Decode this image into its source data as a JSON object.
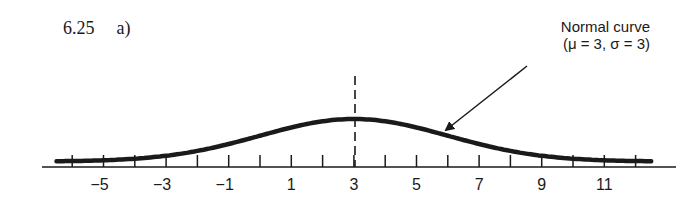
{
  "problem": {
    "number": "6.25",
    "part": "a)"
  },
  "annotation": {
    "line1": "Normal curve",
    "line2": "(μ = 3, σ = 3)"
  },
  "colors": {
    "ink": "#1a1a1a",
    "background": "#ffffff"
  },
  "chart_data": {
    "type": "line",
    "series": [
      {
        "name": "Normal curve (μ = 3, σ = 3)",
        "distribution": "normal",
        "mu": 3,
        "sigma": 3
      }
    ],
    "x": [
      -6,
      -5,
      -4,
      -3,
      -2,
      -1,
      0,
      1,
      2,
      3,
      4,
      5,
      6,
      7,
      8,
      9,
      10,
      11,
      12
    ],
    "xlabel": "",
    "ylabel": "",
    "tick_labels": [
      "−5",
      "−3",
      "−1",
      "1",
      "3",
      "5",
      "7",
      "9",
      "11"
    ],
    "labeled_ticks": [
      -5,
      -3,
      -1,
      1,
      3,
      5,
      7,
      9,
      11
    ],
    "xlim": [
      -6.5,
      12.5
    ],
    "annotations": [
      {
        "type": "dashed-vertical-line",
        "x": 3,
        "meaning": "mean μ = 3"
      },
      {
        "type": "arrow",
        "text": "Normal curve (μ = 3, σ = 3)",
        "points_to_x": 5.8
      }
    ],
    "grid": false,
    "legend": "none"
  }
}
